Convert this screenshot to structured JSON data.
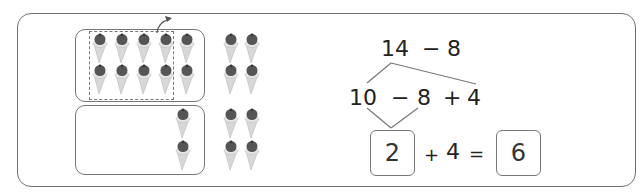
{
  "figure": {
    "left_panel": {
      "top_box_cones": 10,
      "dashed_group_cones": 8,
      "bottom_box_cones": 2,
      "loose_cones": 8,
      "arrow": "move-out-arrow"
    },
    "right_panel": {
      "line1": {
        "a": "14",
        "op": "−",
        "b": "8"
      },
      "line2": {
        "a": "10",
        "op1": "−",
        "b": "8",
        "op2": "+",
        "c": "4"
      },
      "line3": {
        "ans1": "2",
        "op": "+",
        "c": "4",
        "eq": "=",
        "ans2": "6"
      }
    }
  },
  "colors": {
    "border": "#777777",
    "cone": "#d8d8d8",
    "scoop": "#555555",
    "text": "#222222"
  }
}
